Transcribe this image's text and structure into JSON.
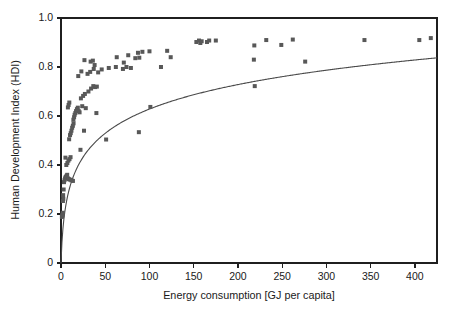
{
  "chart_data": {
    "type": "scatter",
    "title": "",
    "xlabel": "Energy consumption [GJ per capita]",
    "ylabel": "Human Development Index (HDI)",
    "xlim": [
      0,
      425
    ],
    "ylim": [
      0,
      1.0
    ],
    "xticks": [
      0,
      50,
      100,
      150,
      200,
      250,
      300,
      350,
      400
    ],
    "xticklabels": [
      "0",
      "50",
      "100",
      "150",
      "200",
      "250",
      "300",
      "350",
      "400"
    ],
    "yticks": [
      0,
      0.2,
      0.4,
      0.6,
      0.8,
      1.0
    ],
    "yticklabels": [
      "0",
      "0.2",
      "0.4",
      "0.6",
      "0.8",
      "1.0"
    ],
    "grid": false,
    "legend": null,
    "marker_color": "#585858",
    "marker_shape": "square",
    "curve_color": "#4a4a4a",
    "series": [
      {
        "name": "Countries",
        "type": "scatter",
        "points": [
          [
            1.0,
            0.188
          ],
          [
            1.4,
            0.192
          ],
          [
            1.6,
            0.197
          ],
          [
            2.0,
            0.205
          ],
          [
            2.2,
            0.253
          ],
          [
            2.6,
            0.262
          ],
          [
            2.4,
            0.277
          ],
          [
            3.0,
            0.3
          ],
          [
            3.4,
            0.33
          ],
          [
            4.0,
            0.338
          ],
          [
            4.6,
            0.345
          ],
          [
            5.2,
            0.35
          ],
          [
            5.8,
            0.352
          ],
          [
            6.4,
            0.356
          ],
          [
            7.0,
            0.36
          ],
          [
            8.0,
            0.345
          ],
          [
            9.0,
            0.342
          ],
          [
            10.5,
            0.34
          ],
          [
            12.0,
            0.337
          ],
          [
            13.5,
            0.335
          ],
          [
            6.0,
            0.4
          ],
          [
            7.2,
            0.408
          ],
          [
            8.4,
            0.418
          ],
          [
            9.6,
            0.424
          ],
          [
            5.0,
            0.43
          ],
          [
            10.8,
            0.432
          ],
          [
            22.0,
            0.462
          ],
          [
            9.2,
            0.505
          ],
          [
            10.2,
            0.522
          ],
          [
            11.0,
            0.53
          ],
          [
            11.8,
            0.54
          ],
          [
            12.6,
            0.552
          ],
          [
            13.4,
            0.56
          ],
          [
            14.2,
            0.57
          ],
          [
            26.0,
            0.54
          ],
          [
            51.0,
            0.504
          ],
          [
            88.0,
            0.534
          ],
          [
            14.0,
            0.585
          ],
          [
            14.8,
            0.595
          ],
          [
            15.4,
            0.605
          ],
          [
            16.2,
            0.612
          ],
          [
            17.0,
            0.62
          ],
          [
            18.0,
            0.628
          ],
          [
            19.0,
            0.634
          ],
          [
            20.0,
            0.62
          ],
          [
            21.0,
            0.615
          ],
          [
            8.6,
            0.645
          ],
          [
            9.4,
            0.655
          ],
          [
            7.8,
            0.635
          ],
          [
            24.0,
            0.64
          ],
          [
            28.0,
            0.632
          ],
          [
            40.0,
            0.612
          ],
          [
            101.0,
            0.637
          ],
          [
            22.5,
            0.672
          ],
          [
            25.0,
            0.682
          ],
          [
            27.0,
            0.69
          ],
          [
            31.0,
            0.7
          ],
          [
            34.0,
            0.712
          ],
          [
            36.5,
            0.722
          ],
          [
            38.5,
            0.718
          ],
          [
            40.5,
            0.72
          ],
          [
            19.5,
            0.763
          ],
          [
            23.0,
            0.782
          ],
          [
            30.0,
            0.772
          ],
          [
            33.0,
            0.78
          ],
          [
            37.0,
            0.792
          ],
          [
            42.0,
            0.778
          ],
          [
            46.0,
            0.79
          ],
          [
            54.0,
            0.796
          ],
          [
            62.0,
            0.8
          ],
          [
            70.0,
            0.792
          ],
          [
            74.0,
            0.8
          ],
          [
            79.0,
            0.796
          ],
          [
            26.5,
            0.828
          ],
          [
            33.5,
            0.822
          ],
          [
            36.0,
            0.826
          ],
          [
            38.0,
            0.808
          ],
          [
            63.0,
            0.84
          ],
          [
            71.0,
            0.818
          ],
          [
            84.0,
            0.836
          ],
          [
            88.5,
            0.838
          ],
          [
            113.0,
            0.8
          ],
          [
            124.0,
            0.84
          ],
          [
            218.0,
            0.83
          ],
          [
            276.0,
            0.822
          ],
          [
            76.0,
            0.848
          ],
          [
            87.0,
            0.858
          ],
          [
            92.0,
            0.862
          ],
          [
            100.0,
            0.864
          ],
          [
            120.0,
            0.866
          ],
          [
            218.5,
            0.888
          ],
          [
            249.0,
            0.89
          ],
          [
            153.0,
            0.902
          ],
          [
            156.0,
            0.908
          ],
          [
            157.5,
            0.898
          ],
          [
            159.0,
            0.905
          ],
          [
            165.0,
            0.902
          ],
          [
            167.5,
            0.908
          ],
          [
            175.0,
            0.908
          ],
          [
            232.0,
            0.91
          ],
          [
            262.0,
            0.912
          ],
          [
            343.0,
            0.91
          ],
          [
            405.0,
            0.91
          ],
          [
            418.0,
            0.918
          ],
          [
            219.0,
            0.722
          ]
        ]
      },
      {
        "name": "Logarithmic fit",
        "type": "line",
        "description": "Fitted saturating curve rising steeply from 0 then flattening toward 0.87"
      }
    ]
  },
  "axes": {
    "y_title": "Human Development Index (HDI)",
    "x_title": "Energy consumption [GJ per capita]"
  }
}
